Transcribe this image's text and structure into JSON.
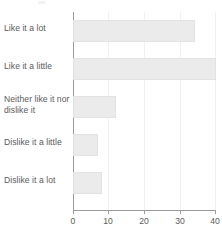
{
  "chart_data": {
    "type": "bar",
    "orientation": "horizontal",
    "title": "",
    "xlabel": "",
    "ylabel": "",
    "categories": [
      "Like it a lot",
      "Like it a little",
      "Neither like it nor dislike it",
      "Dislike it a little",
      "Dislike it a lot"
    ],
    "values": [
      34,
      40,
      12,
      7,
      8
    ],
    "xlim": [
      0,
      40
    ],
    "xticks": [
      0,
      10,
      20,
      30,
      40
    ],
    "xtick_labels": [
      "0",
      "10",
      "20",
      "30",
      "40"
    ],
    "grid": "vertical",
    "legend": "none",
    "colors": {
      "bar_fill": "#ebebeb",
      "bar_border": "#e2e2e2",
      "axis": "#9a9a9a",
      "gridline": "#f0f0f0",
      "text": "#5b5b5b",
      "background": "#ffffff"
    }
  }
}
